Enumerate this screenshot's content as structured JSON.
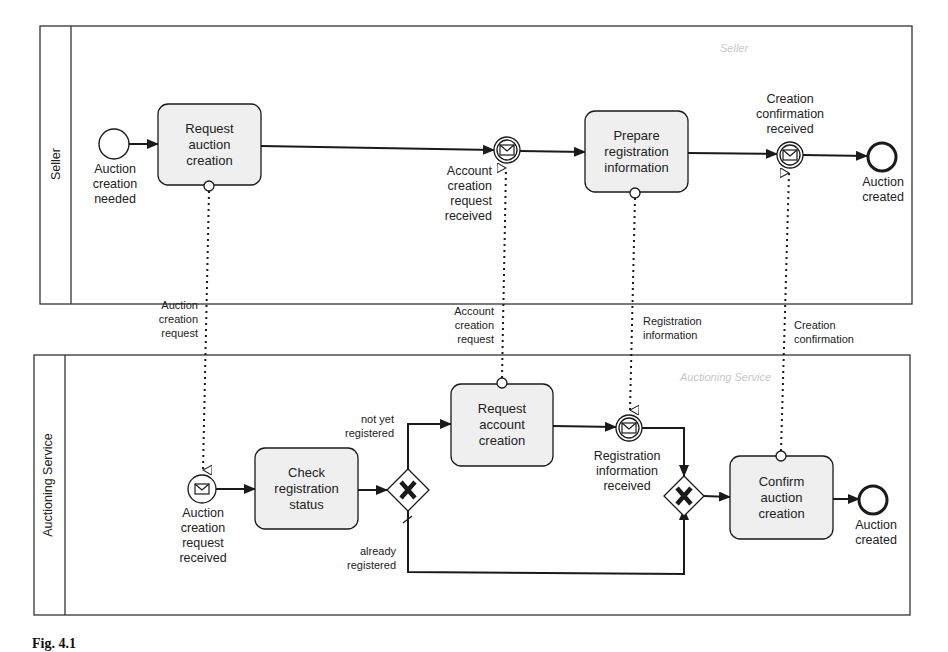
{
  "caption": "Fig. 4.1",
  "pools": {
    "seller": {
      "name": "Seller",
      "ghost_label": "Seller"
    },
    "auctioning": {
      "name": "Auctioning Service",
      "ghost_label": "Auctioning Service"
    }
  },
  "seller_elements": {
    "start_event": "Auction\ncreation\nneeded",
    "task_request_auction": "Request\nauction\ncreation",
    "catch_account_request": "Account\ncreation\nrequest\nreceived",
    "task_prepare_registration": "Prepare\nregistration\ninformation",
    "catch_creation_confirmation": "Creation\nconfirmation\nreceived",
    "end_event": "Auction\ncreated"
  },
  "auctioning_elements": {
    "start_message_event": "Auction\ncreation\nrequest\nreceived",
    "task_check_registration": "Check\nregistration\nstatus",
    "gateway_split_label": "X",
    "branch_not_registered": "not yet\nregistered",
    "branch_already_registered": "already\nregistered",
    "task_request_account": "Request\naccount\ncreation",
    "catch_registration_info": "Registration\ninformation\nreceived",
    "gateway_join_label": "X",
    "task_confirm_auction": "Confirm\nauction\ncreation",
    "end_event": "Auction\ncreated"
  },
  "message_flows": {
    "auction_creation_request": "Auction\ncreation\nrequest",
    "account_creation_request": "Account\ncreation\nrequest",
    "registration_information": "Registration\ninformation",
    "creation_confirmation": "Creation\nconfirmation"
  },
  "colors": {
    "task_fill": "#efefef",
    "stroke": "#1a1a1a",
    "ghost_text": "#c8c8c8"
  }
}
